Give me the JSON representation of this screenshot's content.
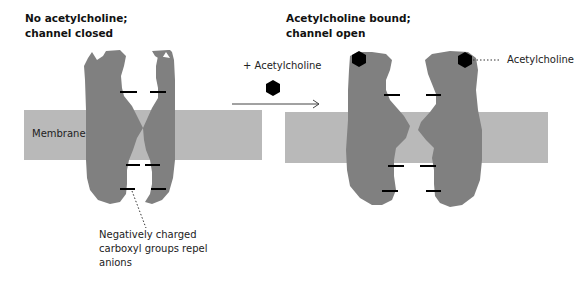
{
  "panels": {
    "closed": {
      "title_line1": "No acetylcholine;",
      "title_line2": "channel closed",
      "membrane_label": "Membrane",
      "annotation_line1": "Negatively charged",
      "annotation_line2": "carboxyl groups repel",
      "annotation_line3": "anions"
    },
    "open": {
      "title_line1": "Acetylcholine bound;",
      "title_line2": "channel open",
      "ligand_label": "Acetylcholine"
    }
  },
  "transition": {
    "label": "+ Acetylcholine",
    "arrow": "right-arrow"
  },
  "colors": {
    "membrane": "#b9b9b9",
    "protein": "#808080",
    "ligand": "#000000",
    "charge_mark": "#000000"
  }
}
